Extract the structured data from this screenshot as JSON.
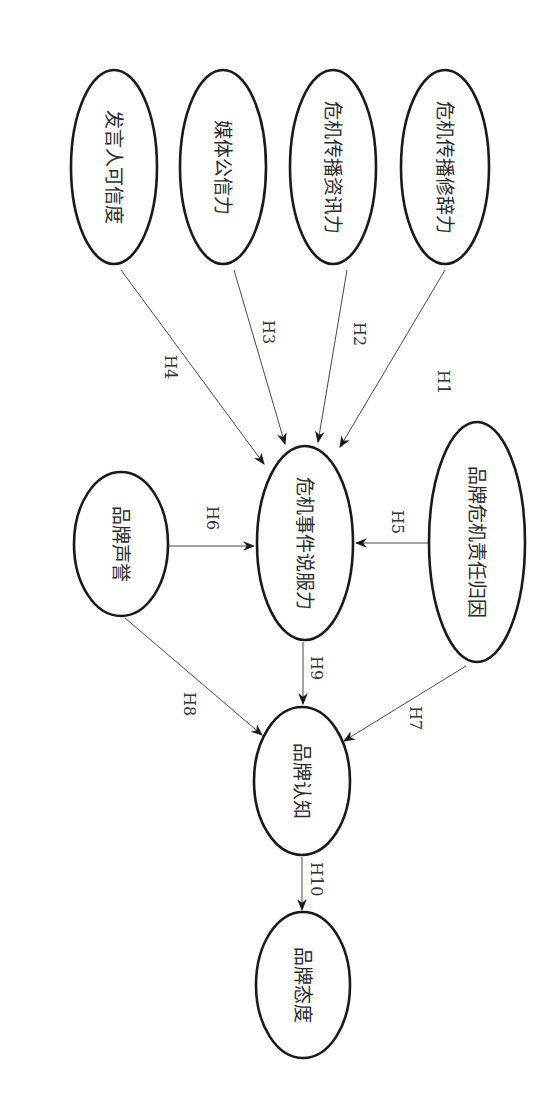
{
  "diagram": {
    "type": "path-model",
    "orientation": "rotated-90-clockwise",
    "nodes": [
      {
        "id": "rhetoric",
        "label": "危机传播修辞力"
      },
      {
        "id": "info",
        "label": "危机传播资讯力"
      },
      {
        "id": "media",
        "label": "媒体公信力"
      },
      {
        "id": "speaker",
        "label": "发言人可信度"
      },
      {
        "id": "persuasion",
        "label": "危机事件说服力"
      },
      {
        "id": "attribution",
        "label": "品牌危机责任归因"
      },
      {
        "id": "reputation",
        "label": "品牌声誉"
      },
      {
        "id": "cognition",
        "label": "品牌认知"
      },
      {
        "id": "attitude",
        "label": "品牌态度"
      }
    ],
    "edges": [
      {
        "label": "H1",
        "from": "rhetoric",
        "to": "persuasion"
      },
      {
        "label": "H2",
        "from": "info",
        "to": "persuasion"
      },
      {
        "label": "H3",
        "from": "media",
        "to": "persuasion"
      },
      {
        "label": "H4",
        "from": "speaker",
        "to": "persuasion"
      },
      {
        "label": "H5",
        "from": "attribution",
        "to": "persuasion"
      },
      {
        "label": "H6",
        "from": "reputation",
        "to": "persuasion"
      },
      {
        "label": "H7",
        "from": "attribution",
        "to": "cognition"
      },
      {
        "label": "H8",
        "from": "reputation",
        "to": "cognition"
      },
      {
        "label": "H9",
        "from": "persuasion",
        "to": "cognition"
      },
      {
        "label": "H10",
        "from": "cognition",
        "to": "attitude"
      }
    ]
  }
}
